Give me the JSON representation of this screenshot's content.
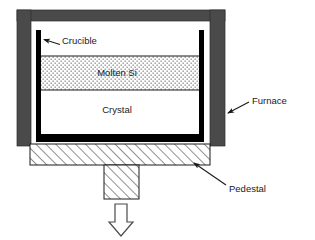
{
  "diagram": {
    "colors": {
      "furnace_gray": "#4a4a4a",
      "crucible_black": "#000000",
      "melt_fill": "#ffffff",
      "melt_stipple": "#555555",
      "hatch_line": "#333333",
      "outline": "#000000",
      "background": "#ffffff",
      "text": "#1a1a1a"
    },
    "callouts": [
      {
        "id": "crucible",
        "label": "Crucible",
        "text_x": 62,
        "text_y": 43,
        "anchor": "start",
        "arrow_from_x": 62,
        "arrow_from_y": 45,
        "arrow_to_x": 42,
        "arrow_to_y": 39
      },
      {
        "id": "furnace",
        "label": "Furnace",
        "text_x": 253,
        "text_y": 105,
        "anchor": "start",
        "arrow_from_x": 250,
        "arrow_from_y": 103,
        "arrow_to_x": 226,
        "arrow_to_y": 114
      },
      {
        "id": "pedestal",
        "label": "Pedestal",
        "text_x": 230,
        "text_y": 190,
        "anchor": "start",
        "arrow_from_x": 228,
        "arrow_from_y": 186,
        "arrow_to_x": 192,
        "arrow_to_y": 162
      }
    ],
    "regions": [
      {
        "id": "molten-si",
        "label": "Molten Si",
        "x": 117,
        "y": 76
      },
      {
        "id": "crystal",
        "label": "Crystal",
        "x": 117,
        "y": 113
      }
    ],
    "parts": {
      "furnace_wall_left": {
        "x": 17,
        "y": 10,
        "width": 14,
        "height": 136
      },
      "furnace_wall_right": {
        "x": 210,
        "y": 10,
        "width": 15,
        "height": 136
      },
      "furnace_top": {
        "x": 17,
        "y": 10,
        "width": 208,
        "height": 11
      },
      "crucible_wall_left": {
        "x": 36,
        "y": 30,
        "width": 5,
        "height": 112
      },
      "crucible_wall_right": {
        "x": 199,
        "y": 30,
        "width": 5,
        "height": 112
      },
      "crucible_bottom": {
        "x": 36,
        "y": 134,
        "width": 168,
        "height": 8
      },
      "melt_region": {
        "x": 41,
        "y": 56,
        "width": 158,
        "height": 34
      },
      "crystal_region": {
        "x": 41,
        "y": 90,
        "width": 158,
        "height": 44
      },
      "pedestal_plate": {
        "x": 30,
        "y": 144,
        "width": 180,
        "height": 21
      },
      "pedestal_stem": {
        "x": 104,
        "y": 165,
        "width": 35,
        "height": 34
      },
      "motion_arrow": {
        "x": 112,
        "y": 203,
        "width": 18,
        "height": 32,
        "direction": "down"
      }
    }
  }
}
